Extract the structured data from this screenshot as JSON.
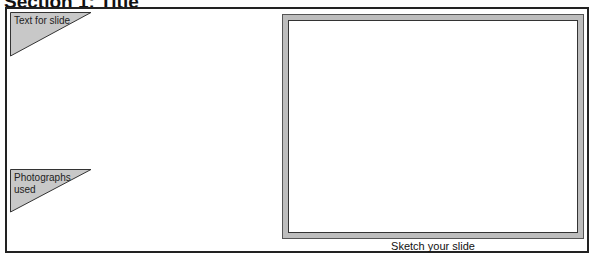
{
  "header": {
    "title": "Section 1: Title"
  },
  "labels": {
    "text_for_slide": "Text for slide",
    "photographs_used": "Photographs used"
  },
  "slide": {
    "caption": "Sketch your slide"
  },
  "colors": {
    "triangle_fill": "#c8c8c8",
    "frame_fill": "#bdbdbd",
    "border": "#222222"
  }
}
